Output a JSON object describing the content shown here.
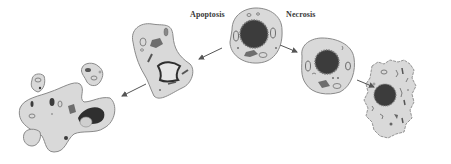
{
  "diagram": {
    "type": "cell-death-pathways",
    "labels": {
      "apoptosis": "Apoptosis",
      "necrosis": "Necrosis"
    },
    "colors": {
      "background": "#ffffff",
      "cytoplasm": "#d9d9d9",
      "membrane": "#8a8a8a",
      "nucleus": "#3c3c3c",
      "organelle": "#6e6e6e",
      "arrow": "#555555",
      "label": "#3a3a3a"
    },
    "nodes": [
      {
        "id": "normal-cell",
        "description": "Normal cell (start)"
      },
      {
        "id": "apoptosis-shrunken-cell",
        "description": "Shrunken cell with condensed chromatin"
      },
      {
        "id": "apoptotic-bodies",
        "description": "Fragmented cell forming apoptotic bodies"
      },
      {
        "id": "necrosis-swollen-cell",
        "description": "Swollen cell"
      },
      {
        "id": "necrosis-ruptured-cell",
        "description": "Ruptured cell with disintegrating membrane"
      }
    ],
    "edges": [
      {
        "from": "normal-cell",
        "to": "apoptosis-shrunken-cell"
      },
      {
        "from": "apoptosis-shrunken-cell",
        "to": "apoptotic-bodies"
      },
      {
        "from": "normal-cell",
        "to": "necrosis-swollen-cell"
      },
      {
        "from": "necrosis-swollen-cell",
        "to": "necrosis-ruptured-cell"
      }
    ]
  }
}
